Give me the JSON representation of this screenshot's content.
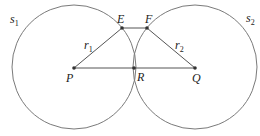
{
  "diagram": {
    "stroke_color": "#7a7a7a",
    "line_color": "#555555",
    "point_color": "#333333",
    "circles": [
      {
        "id": "s1",
        "label": "s",
        "subscript": "1",
        "cx": 74,
        "cy": 68,
        "r": 62
      },
      {
        "id": "s2",
        "label": "s",
        "subscript": "2",
        "cx": 195,
        "cy": 68,
        "r": 62
      }
    ],
    "points": [
      {
        "id": "P",
        "label": "P",
        "x": 74,
        "y": 68
      },
      {
        "id": "R",
        "label": "R",
        "x": 134,
        "y": 68
      },
      {
        "id": "Q",
        "label": "Q",
        "x": 195,
        "y": 68
      },
      {
        "id": "E",
        "label": "E",
        "x": 122,
        "y": 28
      },
      {
        "id": "F",
        "label": "F",
        "x": 147,
        "y": 28
      }
    ],
    "segments": [
      {
        "from": "P",
        "to": "Q"
      },
      {
        "from": "P",
        "to": "E"
      },
      {
        "from": "E",
        "to": "F"
      },
      {
        "from": "F",
        "to": "Q"
      }
    ],
    "radius_labels": [
      {
        "label": "r",
        "subscript": "1",
        "x": 91,
        "y": 48
      },
      {
        "label": "r",
        "subscript": "2",
        "x": 174,
        "y": 48
      }
    ]
  }
}
